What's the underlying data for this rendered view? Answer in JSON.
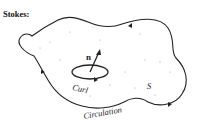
{
  "figure": {
    "title": "Stokes:",
    "labels": {
      "normal": "n",
      "curl": "Curl",
      "surface": "S",
      "circulation": "Circulation"
    },
    "colors": {
      "stroke": "#222222",
      "background": "#ffffff"
    }
  }
}
